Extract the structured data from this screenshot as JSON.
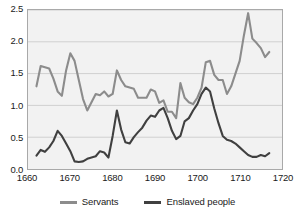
{
  "chart_data": {
    "type": "line",
    "title": "",
    "subtitle": "",
    "xlabel": "",
    "ylabel": "",
    "xlim": [
      1660,
      1720
    ],
    "ylim": [
      0.0,
      2.5
    ],
    "xticks": [
      1660,
      1670,
      1680,
      1690,
      1700,
      1710,
      1720
    ],
    "yticks": [
      "0.0",
      "0.5",
      "1.0",
      "1.5",
      "2.0",
      "2.5"
    ],
    "ytick_values": [
      0.0,
      0.5,
      1.0,
      1.5,
      2.0,
      2.5
    ],
    "grid": "horizontal",
    "legend_position": "bottom",
    "plot_background": "#f2f2f2",
    "series": [
      {
        "name": "Servants",
        "color": "#8c8c8c",
        "x": [
          1662,
          1663,
          1664,
          1665,
          1666,
          1667,
          1668,
          1669,
          1670,
          1671,
          1672,
          1673,
          1674,
          1675,
          1676,
          1677,
          1678,
          1679,
          1680,
          1681,
          1682,
          1683,
          1684,
          1685,
          1686,
          1687,
          1688,
          1689,
          1690,
          1691,
          1692,
          1693,
          1694,
          1695,
          1696,
          1697,
          1698,
          1699,
          1700,
          1701,
          1702,
          1703,
          1704,
          1705,
          1706,
          1707,
          1708,
          1709,
          1710,
          1711,
          1712,
          1713,
          1714,
          1715,
          1716,
          1717
        ],
        "values": [
          1.3,
          1.62,
          1.6,
          1.58,
          1.42,
          1.22,
          1.15,
          1.55,
          1.82,
          1.7,
          1.4,
          1.1,
          0.92,
          1.05,
          1.18,
          1.16,
          1.22,
          1.14,
          1.18,
          1.55,
          1.4,
          1.3,
          1.28,
          1.26,
          1.12,
          1.12,
          1.12,
          1.25,
          1.22,
          1.04,
          1.08,
          0.9,
          0.9,
          0.8,
          1.35,
          1.12,
          1.05,
          1.02,
          1.12,
          1.28,
          1.68,
          1.7,
          1.48,
          1.4,
          1.4,
          1.18,
          1.3,
          1.5,
          1.7,
          2.1,
          2.45,
          2.05,
          1.98,
          1.9,
          1.76,
          1.84
        ]
      },
      {
        "name": "Enslaved people",
        "color": "#404040",
        "x": [
          1662,
          1663,
          1664,
          1665,
          1666,
          1667,
          1668,
          1669,
          1670,
          1671,
          1672,
          1673,
          1674,
          1675,
          1676,
          1677,
          1678,
          1679,
          1680,
          1681,
          1682,
          1683,
          1684,
          1685,
          1686,
          1687,
          1688,
          1689,
          1690,
          1691,
          1692,
          1693,
          1694,
          1695,
          1696,
          1697,
          1698,
          1699,
          1700,
          1701,
          1702,
          1703,
          1704,
          1705,
          1706,
          1707,
          1708,
          1709,
          1710,
          1711,
          1712,
          1713,
          1714,
          1715,
          1716,
          1717
        ],
        "values": [
          0.21,
          0.3,
          0.27,
          0.34,
          0.44,
          0.6,
          0.52,
          0.4,
          0.28,
          0.12,
          0.11,
          0.12,
          0.16,
          0.18,
          0.2,
          0.28,
          0.26,
          0.18,
          0.52,
          0.92,
          0.62,
          0.42,
          0.4,
          0.5,
          0.58,
          0.65,
          0.76,
          0.84,
          0.82,
          0.92,
          0.96,
          0.8,
          0.6,
          0.47,
          0.52,
          0.75,
          0.8,
          0.92,
          1.02,
          1.18,
          1.28,
          1.22,
          0.95,
          0.72,
          0.52,
          0.46,
          0.44,
          0.4,
          0.34,
          0.28,
          0.22,
          0.19,
          0.19,
          0.22,
          0.2,
          0.25
        ]
      }
    ]
  },
  "legend": {
    "items": [
      {
        "label": "Servants",
        "color": "#8c8c8c"
      },
      {
        "label": "Enslaved people",
        "color": "#404040"
      }
    ]
  }
}
